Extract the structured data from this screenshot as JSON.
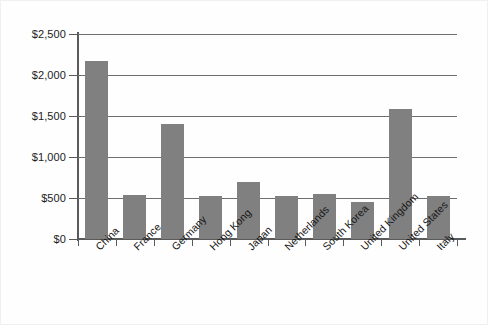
{
  "chart_data": {
    "type": "bar",
    "title": "",
    "subtitle": "",
    "xlabel": "",
    "ylabel": "",
    "categories": [
      "China",
      "France",
      "Germany",
      "Hong Kong",
      "Japan",
      "Netherlands",
      "South Korea",
      "United Kingdom",
      "United States",
      "Italy"
    ],
    "values": [
      2165,
      540,
      1405,
      530,
      690,
      525,
      555,
      450,
      1585,
      520
    ],
    "ylim": [
      0,
      2500
    ],
    "ytick_values": [
      0,
      500,
      1000,
      1500,
      2000,
      2500
    ],
    "ytick_labels": [
      "$0",
      "$500",
      "$1,000",
      "$1,500",
      "$2,000",
      "$2,500"
    ],
    "grid": true,
    "grid_axis": "y",
    "legend": false,
    "legend_position": "none",
    "bar_color": "#808080",
    "axis_color": "#5a5a5a",
    "gridline_color": "#6e6e6e",
    "background_color": "#fefefe",
    "xtick_label_rotation": -45
  }
}
